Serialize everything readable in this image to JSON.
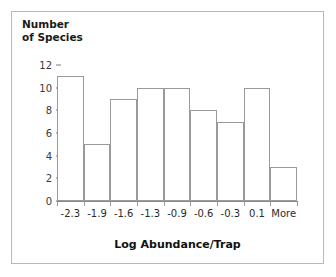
{
  "chart_data": {
    "type": "bar",
    "title": "",
    "subtitle": "",
    "xlabel": "Log Abundance/Trap",
    "ylabel": "Number of Species",
    "ylabel_lines": [
      "Number",
      "of Species"
    ],
    "categories": [
      "-2.3",
      "-1.9",
      "-1.6",
      "-1.3",
      "-0.9",
      "-0.6",
      "-0.3",
      "0.1",
      "More"
    ],
    "values": [
      11,
      5,
      9,
      10,
      10,
      8,
      7,
      10,
      3
    ],
    "yticks": [
      0,
      2,
      4,
      6,
      8,
      10,
      12
    ],
    "ytick_labels": [
      "0",
      "2",
      "4",
      "6",
      "8",
      "10",
      "12"
    ],
    "ylim": [
      0,
      12
    ],
    "grid": false,
    "legend": null,
    "bar_fill_color": "#ffffff",
    "bar_edge_color": "#9a9a9a",
    "axis_color": "#8c8c8c",
    "text_color": "#1a1a1a",
    "background_color": "#ffffff",
    "frame_color": "#b9b9b9"
  }
}
